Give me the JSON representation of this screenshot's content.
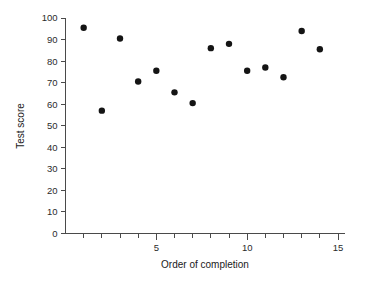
{
  "chart_data": {
    "type": "scatter",
    "title": "",
    "xlabel": "Order of completion",
    "ylabel": "Test score",
    "xlim": [
      0,
      15
    ],
    "ylim": [
      0,
      100
    ],
    "grid": false,
    "legend": null,
    "x_ticks_labeled": [
      5,
      10,
      15
    ],
    "x_tick_labels": [
      "5",
      "10",
      "15"
    ],
    "x_minor_tick_step": 1,
    "y_ticks": [
      0,
      10,
      20,
      30,
      40,
      50,
      60,
      70,
      80,
      90,
      100
    ],
    "y_tick_labels": [
      "0",
      "10",
      "20",
      "30",
      "40",
      "50",
      "60",
      "70",
      "80",
      "90",
      "100"
    ],
    "marker": {
      "shape": "circle",
      "color": "#141414",
      "size_px": 3.2
    },
    "x": [
      1,
      2,
      3,
      4,
      5,
      6,
      7,
      8,
      9,
      10,
      11,
      12,
      13,
      14
    ],
    "y": [
      95.5,
      57,
      90.5,
      70.5,
      75.5,
      65.5,
      60.5,
      86,
      88,
      75.5,
      77,
      72.5,
      94,
      85.5
    ],
    "points": [
      {
        "x": 1,
        "y": 95.5
      },
      {
        "x": 2,
        "y": 57
      },
      {
        "x": 3,
        "y": 90.5
      },
      {
        "x": 4,
        "y": 70.5
      },
      {
        "x": 5,
        "y": 75.5
      },
      {
        "x": 6,
        "y": 65.5
      },
      {
        "x": 7,
        "y": 60.5
      },
      {
        "x": 8,
        "y": 86
      },
      {
        "x": 9,
        "y": 88
      },
      {
        "x": 10,
        "y": 75.5
      },
      {
        "x": 11,
        "y": 77
      },
      {
        "x": 12,
        "y": 72.5
      },
      {
        "x": 13,
        "y": 94
      },
      {
        "x": 14,
        "y": 85.5
      }
    ]
  },
  "axes": {
    "y_label": "Test score",
    "x_label": "Order of completion",
    "y_tick_labels": [
      "100",
      "90",
      "80",
      "70",
      "60",
      "50",
      "40",
      "30",
      "20",
      "10",
      "0"
    ],
    "x_tick_labels": [
      "5",
      "10",
      "15"
    ]
  },
  "colors": {
    "marker": "#141414",
    "axis": "#4a4a4a",
    "text": "#1a1a1a",
    "background": "#ffffff"
  }
}
